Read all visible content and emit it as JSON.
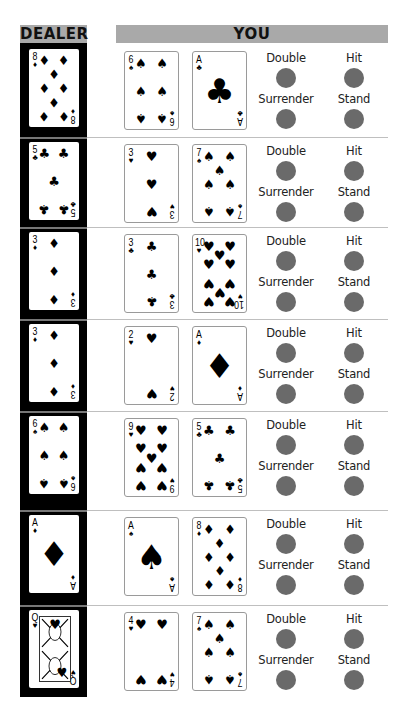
{
  "headers": {
    "dealer": "DEALER",
    "you": "YOU"
  },
  "actions": {
    "double": "Double",
    "hit": "Hit",
    "surrender": "Surrender",
    "stand": "Stand"
  },
  "colors": {
    "header_bg": "#a9a9a9",
    "dealer_bg": "#000000",
    "button": "#6a6a6a",
    "separator": "#bfbfbf"
  },
  "suits": {
    "spades": "♠",
    "hearts": "♥",
    "diamonds": "♦",
    "clubs": "♣"
  },
  "hands": [
    {
      "dealer": {
        "rank": "8",
        "suit": "diamonds"
      },
      "player": [
        {
          "rank": "6",
          "suit": "spades"
        },
        {
          "rank": "A",
          "suit": "clubs"
        }
      ]
    },
    {
      "dealer": {
        "rank": "5",
        "suit": "clubs"
      },
      "player": [
        {
          "rank": "3",
          "suit": "hearts"
        },
        {
          "rank": "7",
          "suit": "spades"
        }
      ]
    },
    {
      "dealer": {
        "rank": "3",
        "suit": "diamonds"
      },
      "player": [
        {
          "rank": "3",
          "suit": "clubs"
        },
        {
          "rank": "10",
          "suit": "hearts"
        }
      ]
    },
    {
      "dealer": {
        "rank": "3",
        "suit": "diamonds"
      },
      "player": [
        {
          "rank": "2",
          "suit": "hearts"
        },
        {
          "rank": "A",
          "suit": "diamonds"
        }
      ]
    },
    {
      "dealer": {
        "rank": "6",
        "suit": "spades"
      },
      "player": [
        {
          "rank": "9",
          "suit": "hearts"
        },
        {
          "rank": "5",
          "suit": "clubs"
        }
      ]
    },
    {
      "dealer": {
        "rank": "A",
        "suit": "diamonds"
      },
      "player": [
        {
          "rank": "A",
          "suit": "spades"
        },
        {
          "rank": "8",
          "suit": "diamonds"
        }
      ]
    },
    {
      "dealer": {
        "rank": "Q",
        "suit": "hearts"
      },
      "player": [
        {
          "rank": "4",
          "suit": "hearts"
        },
        {
          "rank": "7",
          "suit": "spades"
        }
      ]
    }
  ]
}
